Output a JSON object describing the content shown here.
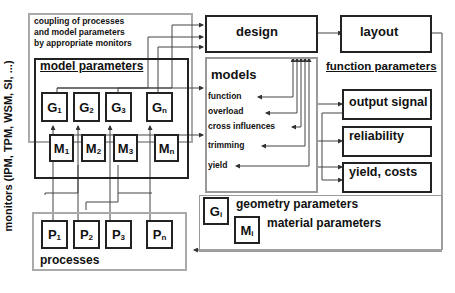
{
  "left_label": "monitors (IPM, TPM, WSM, SI, ...)",
  "coupling_text": [
    "coupling of processes",
    "and model parameters",
    "by appropriate monitors"
  ],
  "model_parameters": {
    "title": "model parameters",
    "geometry": [
      {
        "base": "G",
        "sub": "1"
      },
      {
        "base": "G",
        "sub": "2"
      },
      {
        "base": "G",
        "sub": "3"
      },
      {
        "base": "G",
        "sub": "n"
      }
    ],
    "material": [
      {
        "base": "M",
        "sub": "1"
      },
      {
        "base": "M",
        "sub": "2"
      },
      {
        "base": "M",
        "sub": "3"
      },
      {
        "base": "M",
        "sub": "n"
      }
    ]
  },
  "processes": {
    "title": "processes",
    "items": [
      {
        "base": "P",
        "sub": "1"
      },
      {
        "base": "P",
        "sub": "2"
      },
      {
        "base": "P",
        "sub": "3"
      },
      {
        "base": "P",
        "sub": "n"
      }
    ]
  },
  "design": "design",
  "layout": "layout",
  "models": {
    "title": "models",
    "items": [
      "function",
      "overload",
      "cross influences",
      "trimming",
      "yield"
    ]
  },
  "function_parameters": {
    "title": "function parameters",
    "items": [
      "output signal",
      "reliability",
      "yield, costs"
    ]
  },
  "legend": {
    "geometry": {
      "base": "G",
      "sub": "i",
      "label": "geometry parameters"
    },
    "material": {
      "base": "M",
      "sub": "i",
      "label": "material parameters"
    }
  }
}
